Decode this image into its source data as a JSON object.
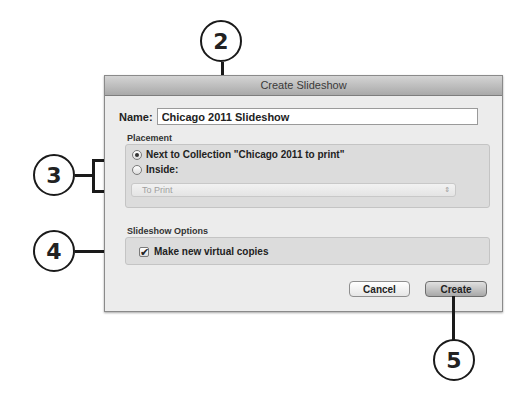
{
  "dialog": {
    "title": "Create Slideshow",
    "name_label": "Name:",
    "name_value": "Chicago 2011 Slideshow",
    "placement": {
      "section_label": "Placement",
      "option_next_to": "Next to Collection \"Chicago 2011 to print\"",
      "option_inside": "Inside:",
      "selected": "next_to",
      "inside_select_value": "To Print",
      "select_arrows": "⇕"
    },
    "options": {
      "section_label": "Slideshow Options",
      "virtual_copies_label": "Make new virtual copies",
      "virtual_copies_checked": true,
      "check_glyph": "✔"
    },
    "buttons": {
      "cancel": "Cancel",
      "create": "Create"
    }
  },
  "callouts": {
    "c2": "2",
    "c3": "3",
    "c4": "4",
    "c5": "5"
  }
}
